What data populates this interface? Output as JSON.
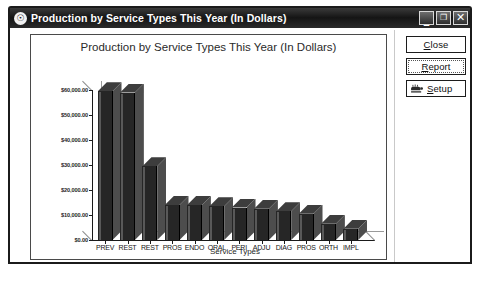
{
  "window": {
    "title": "Production by Service Types This Year (In Dollars)",
    "app_icon": "clock-icon",
    "controls": {
      "minimize": {
        "name": "minimize-icon",
        "glyph": "_"
      },
      "maximize": {
        "name": "maximize-icon",
        "glyph": "❐"
      },
      "close": {
        "name": "close-icon",
        "glyph": "✕"
      }
    }
  },
  "buttons": [
    {
      "name": "close-button",
      "label_pre": "",
      "label_key": "C",
      "label_post": "lose",
      "icon": null
    },
    {
      "name": "report-button",
      "label_pre": "",
      "label_key": "R",
      "label_post": "eport",
      "icon": null
    },
    {
      "name": "setup-button",
      "label_pre": "",
      "label_key": "S",
      "label_post": "etup",
      "icon": "hand-tool-icon"
    }
  ],
  "chart_data": {
    "type": "bar",
    "title": "Production by Service Types This Year (In Dollars)",
    "xlabel": "Service Types",
    "ylabel": "",
    "grid": false,
    "legend": null,
    "ylim": [
      0,
      60000
    ],
    "ytick_labels": [
      "$60,000.00",
      "$50,000.00",
      "$40,000.00",
      "$30,000.00",
      "$20,000.00",
      "$10,000.00",
      "$0.00"
    ],
    "ytick_values": [
      60000,
      50000,
      40000,
      30000,
      20000,
      10000,
      0
    ],
    "categories": [
      "PREV",
      "REST",
      "REST",
      "PROS",
      "ENDO",
      "ORAL",
      "PERI",
      "ADJU",
      "DIAG",
      "PROS",
      "ORTH",
      "IMPL"
    ],
    "values": [
      59500,
      59000,
      29500,
      14000,
      14000,
      13500,
      13000,
      12500,
      11500,
      10500,
      6500,
      4500
    ]
  }
}
